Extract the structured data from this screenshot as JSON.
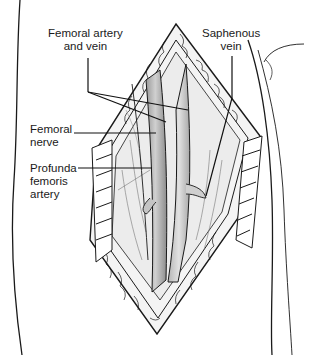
{
  "figure": {
    "colors": {
      "line": "#1a1a1a",
      "vessel_shade": "#8a8a8a",
      "tissue_shade": "#d9d9d9",
      "background": "#ffffff"
    },
    "labels": [
      {
        "id": "femoral-artery-and-vein",
        "lines": [
          "Femoral artery",
          "and vein"
        ]
      },
      {
        "id": "saphenous-vein",
        "lines": [
          "Saphenous",
          "vein"
        ]
      },
      {
        "id": "femoral-nerve",
        "lines": [
          "Femoral",
          "nerve"
        ]
      },
      {
        "id": "profunda-femoris-artery",
        "lines": [
          "Profunda",
          "femoris",
          "artery"
        ]
      }
    ]
  }
}
